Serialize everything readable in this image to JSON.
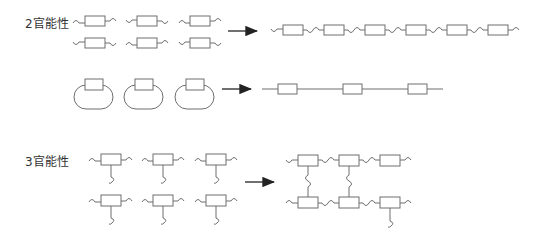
{
  "labels": {
    "bifunctional": "2官能性",
    "trifunctional": "3官能性"
  },
  "colors": {
    "line": "#6e6e6e",
    "arrow": "#222222",
    "text": "#333333"
  },
  "sections": [
    {
      "name": "bifunctional-linear",
      "monomers": 6,
      "product": "linear chain of 6 units"
    },
    {
      "name": "bifunctional-cyclic",
      "monomers": 3,
      "product": "linear chain of 3 units"
    },
    {
      "name": "trifunctional",
      "monomers": 6,
      "product": "branched network"
    }
  ]
}
